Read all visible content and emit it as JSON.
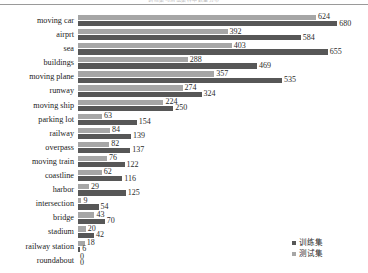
{
  "title_clipped": "训练集与测试集样本数量分布",
  "legend": {
    "position": "bottom-right",
    "entries": [
      {
        "key": "train",
        "label": "训练集",
        "color": "#575757"
      },
      {
        "key": "test",
        "label": "测试集",
        "color": "#a6a6a6"
      }
    ]
  },
  "chart_data": {
    "type": "bar",
    "orientation": "horizontal",
    "title": "训练集与测试集样本数量分布",
    "xlabel": "",
    "ylabel": "",
    "grid": false,
    "legend_position": "bottom-right",
    "xlim": [
      0,
      700
    ],
    "categories": [
      "moving car",
      "airprt",
      "sea",
      "buildings",
      "moving plane",
      "runway",
      "moving ship",
      "parking lot",
      "railway",
      "overpass",
      "moving train",
      "coastline",
      "harbor",
      "intersection",
      "bridge",
      "stadium",
      "railway station",
      "roundabout"
    ],
    "series": [
      {
        "name": "训练集",
        "color": "#575757",
        "values": [
          680,
          584,
          655,
          469,
          535,
          324,
          250,
          154,
          139,
          137,
          122,
          116,
          125,
          54,
          70,
          42,
          6,
          0
        ]
      },
      {
        "name": "测试集",
        "color": "#a6a6a6",
        "values": [
          624,
          392,
          403,
          288,
          357,
          274,
          224,
          63,
          84,
          82,
          76,
          62,
          29,
          9,
          43,
          20,
          18,
          0
        ]
      }
    ],
    "rows": [
      {
        "category": "moving car",
        "test": 624,
        "train": 680
      },
      {
        "category": "airprt",
        "test": 392,
        "train": 584
      },
      {
        "category": "sea",
        "test": 403,
        "train": 655
      },
      {
        "category": "buildings",
        "test": 288,
        "train": 469
      },
      {
        "category": "moving plane",
        "test": 357,
        "train": 535
      },
      {
        "category": "runway",
        "test": 274,
        "train": 324
      },
      {
        "category": "moving ship",
        "test": 224,
        "train": 250
      },
      {
        "category": "parking lot",
        "test": 63,
        "train": 154
      },
      {
        "category": "railway",
        "test": 84,
        "train": 139
      },
      {
        "category": "overpass",
        "test": 82,
        "train": 137
      },
      {
        "category": "moving train",
        "test": 76,
        "train": 122
      },
      {
        "category": "coastline",
        "test": 62,
        "train": 116
      },
      {
        "category": "harbor",
        "test": 29,
        "train": 125
      },
      {
        "category": "intersection",
        "test": 9,
        "train": 54
      },
      {
        "category": "bridge",
        "test": 43,
        "train": 70
      },
      {
        "category": "stadium",
        "test": 20,
        "train": 42
      },
      {
        "category": "railway station",
        "test": 18,
        "train": 6
      },
      {
        "category": "roundabout",
        "test": 0,
        "train": 0
      }
    ]
  }
}
